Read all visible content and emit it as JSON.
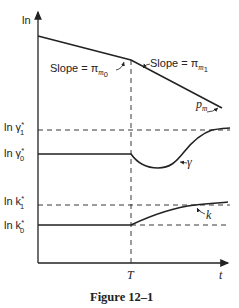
{
  "figure": {
    "caption": "Figure 12–1",
    "y_axis_label": "ln",
    "x_axis_label": "t",
    "x_tick_label": "T",
    "top_panel": {
      "slope_before_label": "Slope = π",
      "slope_before_sub": "m",
      "slope_before_subsub": "0",
      "slope_after_label": "Slope = π",
      "slope_after_sub": "m",
      "slope_after_subsub": "1",
      "curve_label": "p",
      "curve_sub": "m"
    },
    "middle_panel": {
      "level_1_label": "ln γ",
      "level_1_sup": "*",
      "level_1_sub": "1",
      "level_0_label": "ln γ",
      "level_0_sup": "*",
      "level_0_sub": "0",
      "curve_label": "γ"
    },
    "bottom_panel": {
      "level_1_label": "ln k",
      "level_1_sup": "*",
      "level_1_sub": "1",
      "level_0_label": "ln k",
      "level_0_sup": "*",
      "level_0_sub": "0",
      "curve_label": "k"
    },
    "colors": {
      "ink": "#222222",
      "background": "#ffffff"
    }
  }
}
